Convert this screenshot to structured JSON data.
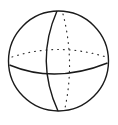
{
  "diagram": {
    "title": "",
    "colors": {
      "stroke": "#1a1a1a",
      "dots": "#333333",
      "background": "#ffffff"
    },
    "elements": [
      {
        "name": "outline-circle",
        "style": "solid"
      },
      {
        "name": "front-meridian",
        "style": "solid"
      },
      {
        "name": "front-equator",
        "style": "solid"
      },
      {
        "name": "back-equator",
        "style": "dotted"
      },
      {
        "name": "back-meridian",
        "style": "dotted"
      }
    ]
  }
}
